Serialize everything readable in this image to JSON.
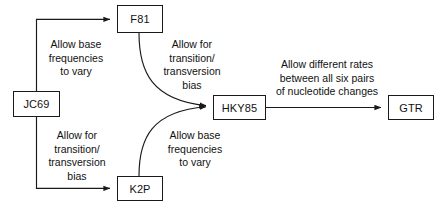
{
  "diagram": {
    "stroke_color": "#1a1a1a",
    "text_color": "#111111",
    "background": "#ffffff",
    "nodes": [
      {
        "id": "jc69",
        "label": "JC69",
        "x": 13,
        "y": 91,
        "w": 47,
        "h": 26
      },
      {
        "id": "f81",
        "label": "F81",
        "x": 117,
        "y": 5,
        "w": 46,
        "h": 28
      },
      {
        "id": "k2p",
        "label": "K2P",
        "x": 117,
        "y": 176,
        "w": 46,
        "h": 25
      },
      {
        "id": "hky85",
        "label": "HKY85",
        "x": 213,
        "y": 95,
        "w": 53,
        "h": 25
      },
      {
        "id": "gtr",
        "label": "GTR",
        "x": 388,
        "y": 95,
        "w": 46,
        "h": 25
      }
    ],
    "edges": [
      {
        "id": "jc69-to-f81",
        "from": "JC69",
        "to": "F81",
        "label": "Allow base\nfrequencies\nto vary"
      },
      {
        "id": "jc69-to-k2p",
        "from": "JC69",
        "to": "K2P",
        "label": "Allow for\ntransition/\ntransversion\nbias"
      },
      {
        "id": "f81-to-hky85",
        "from": "F81",
        "to": "HKY85",
        "label": "Allow for\ntransition/\ntransversion\nbias"
      },
      {
        "id": "k2p-to-hky85",
        "from": "K2P",
        "to": "HKY85",
        "label": "Allow base\nfrequencies\nto vary"
      },
      {
        "id": "hky85-to-gtr",
        "from": "HKY85",
        "to": "GTR",
        "label": "Allow different rates\nbetween all six pairs\nof nucleotide changes"
      }
    ],
    "labels": {
      "top_left": {
        "text": "Allow base\nfrequencies\nto vary",
        "x": 32,
        "y": 38,
        "w": 88
      },
      "top_right": {
        "text": "Allow for\ntransition/\ntransversion\nbias",
        "x": 150,
        "y": 38,
        "w": 84
      },
      "bottom_left": {
        "text": "Allow for\ntransition/\ntransversion\nbias",
        "x": 34,
        "y": 129,
        "w": 86
      },
      "bottom_right": {
        "text": "Allow base\nfrequencies\nto vary",
        "x": 152,
        "y": 129,
        "w": 86
      },
      "right": {
        "text": "Allow different rates\nbetween all six pairs\nof nucleotide changes",
        "x": 260,
        "y": 58,
        "w": 134
      }
    }
  }
}
